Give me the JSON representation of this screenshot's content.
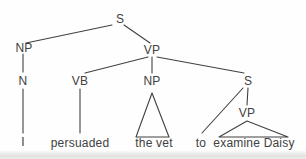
{
  "diagram": {
    "type": "syntax-tree",
    "sentence": "I persuaded the vet to examine Daisy",
    "colors": {
      "ink": "#414141",
      "background": "#fefefe"
    },
    "nodes": {
      "s_root": {
        "label": "S"
      },
      "np_subject": {
        "label": "NP"
      },
      "vp_main": {
        "label": "VP"
      },
      "n_subject": {
        "label": "N"
      },
      "vb": {
        "label": "VB"
      },
      "np_object": {
        "label": "NP"
      },
      "s_embedded": {
        "label": "S"
      },
      "vp_embedded": {
        "label": "VP"
      },
      "word_i": {
        "label": "I"
      },
      "word_persuaded": {
        "label": "persuaded"
      },
      "word_the_vet": {
        "label": "the vet"
      },
      "word_to": {
        "label": "to"
      },
      "word_examine_daisy": {
        "label": "examine Daisy"
      }
    }
  }
}
